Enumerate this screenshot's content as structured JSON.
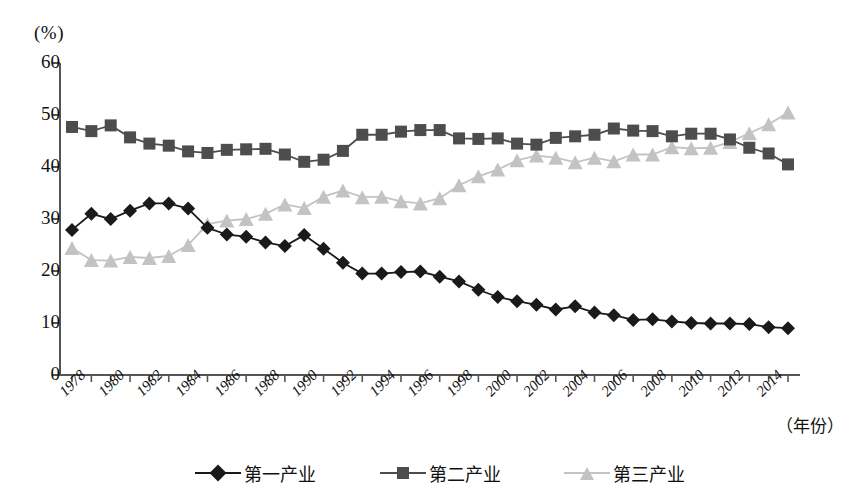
{
  "chart_data": {
    "type": "line",
    "title": "",
    "subtitle": "",
    "xlabel": "（年份）",
    "ylabel": "(%)",
    "ylim": [
      0,
      60
    ],
    "yticks": [
      0,
      10,
      20,
      30,
      40,
      50,
      60
    ],
    "grid": false,
    "legend_position": "bottom",
    "x": [
      1978,
      1979,
      1980,
      1981,
      1982,
      1983,
      1984,
      1985,
      1986,
      1987,
      1988,
      1989,
      1990,
      1991,
      1992,
      1993,
      1994,
      1995,
      1996,
      1997,
      1998,
      1999,
      2000,
      2001,
      2002,
      2003,
      2004,
      2005,
      2006,
      2007,
      2008,
      2009,
      2010,
      2011,
      2012,
      2013,
      2014,
      2015
    ],
    "xticks": [
      "1978",
      "1980",
      "1982",
      "1984",
      "1986",
      "1988",
      "1990",
      "1992",
      "1994",
      "1996",
      "1998",
      "2000",
      "2002",
      "2004",
      "2006",
      "2008",
      "2010",
      "2012",
      "2014"
    ],
    "series": [
      {
        "name": "第一产业",
        "marker": "diamond",
        "color": "#1a1a1a",
        "values": [
          27.9,
          31.0,
          30.0,
          31.6,
          33.0,
          33.0,
          32.0,
          28.3,
          27.0,
          26.6,
          25.5,
          24.8,
          26.9,
          24.3,
          21.6,
          19.5,
          19.5,
          19.8,
          19.9,
          18.9,
          18.0,
          16.4,
          15.0,
          14.2,
          13.5,
          12.6,
          13.2,
          12.0,
          11.5,
          10.6,
          10.7,
          10.3,
          10.0,
          9.9,
          9.9,
          9.8,
          9.2,
          9.0
        ]
      },
      {
        "name": "第二产业",
        "marker": "square",
        "color": "#4d4d4d",
        "values": [
          47.7,
          46.9,
          48.0,
          45.7,
          44.5,
          44.1,
          43.0,
          42.7,
          43.3,
          43.4,
          43.5,
          42.4,
          41.0,
          41.4,
          43.1,
          46.2,
          46.2,
          46.8,
          47.1,
          47.1,
          45.5,
          45.4,
          45.5,
          44.5,
          44.3,
          45.6,
          45.9,
          46.2,
          47.4,
          47.0,
          46.9,
          45.9,
          46.4,
          46.4,
          45.3,
          43.7,
          42.6,
          40.5
        ]
      },
      {
        "name": "第三产业",
        "marker": "triangle",
        "color": "#c3c3c3",
        "values": [
          24.4,
          22.1,
          22.0,
          22.7,
          22.5,
          22.9,
          25.0,
          29.0,
          29.7,
          30.0,
          31.0,
          32.8,
          32.1,
          34.3,
          35.5,
          34.2,
          34.3,
          33.4,
          33.0,
          34.0,
          36.5,
          38.2,
          39.5,
          41.3,
          42.2,
          41.8,
          40.9,
          41.8,
          41.1,
          42.4,
          42.4,
          43.8,
          43.6,
          43.7,
          44.8,
          46.5,
          48.2,
          50.5
        ]
      }
    ]
  }
}
